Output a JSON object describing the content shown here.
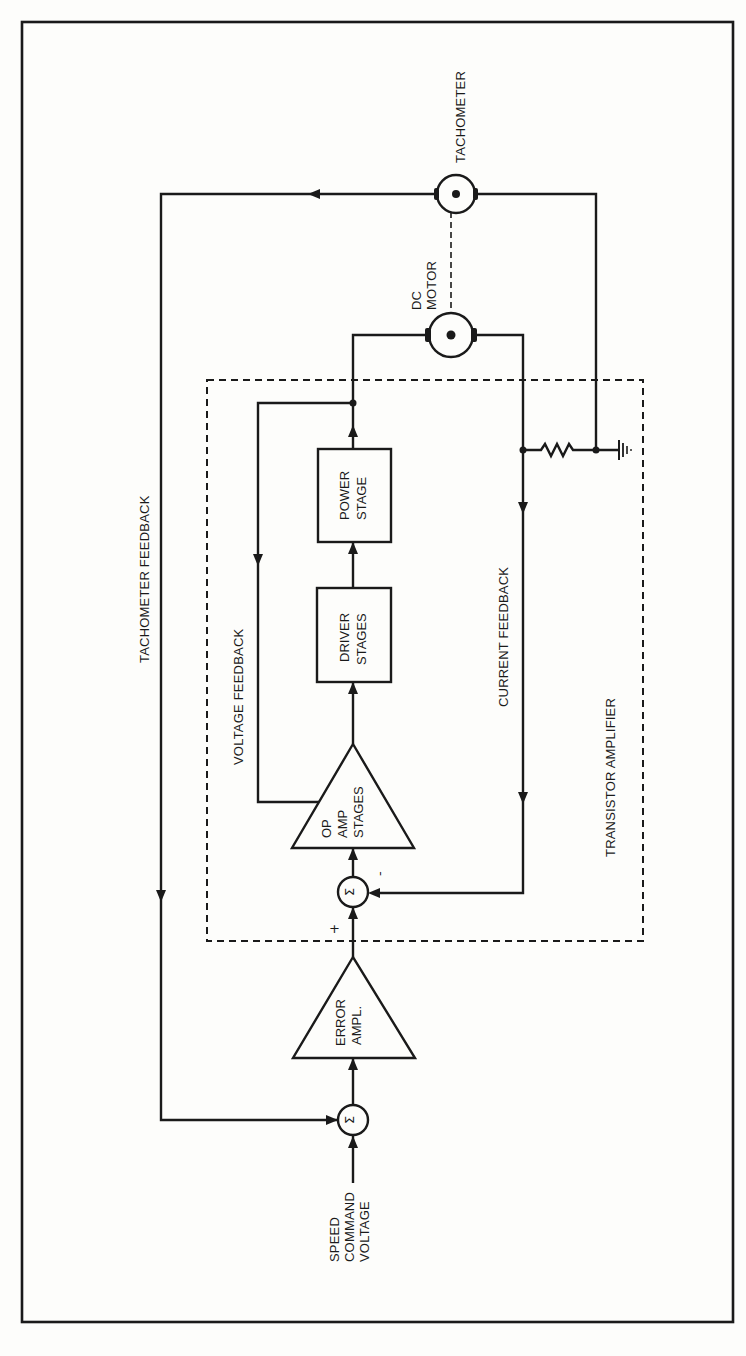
{
  "figure": {
    "orientation": "rotated-90-ccw"
  },
  "blocks": {
    "tachometer": {
      "label": "TACHOMETER"
    },
    "dc_motor": {
      "label_line1": "DC",
      "label_line2": "MOTOR"
    },
    "power_stage": {
      "line1": "POWER",
      "line2": "STAGE"
    },
    "driver_stages": {
      "line1": "DRIVER",
      "line2": "STAGES"
    },
    "op_amp": {
      "line1": "OP",
      "line2": "AMP",
      "line3": "STAGES"
    },
    "error_amp": {
      "line1": "ERROR",
      "line2": "AMPL."
    },
    "summing_junction_symbol": "Σ",
    "transistor_amplifier": {
      "label": "TRANSISTOR AMPLIFIER"
    }
  },
  "signals": {
    "tachometer_feedback": "TACHOMETER FEEDBACK",
    "voltage_feedback": "VOLTAGE FEEDBACK",
    "current_feedback": "CURRENT FEEDBACK",
    "speed_command": {
      "line1": "SPEED",
      "line2": "COMMAND",
      "line3": "VOLTAGE"
    },
    "plus_sign": "+",
    "minus_sign": "-"
  }
}
